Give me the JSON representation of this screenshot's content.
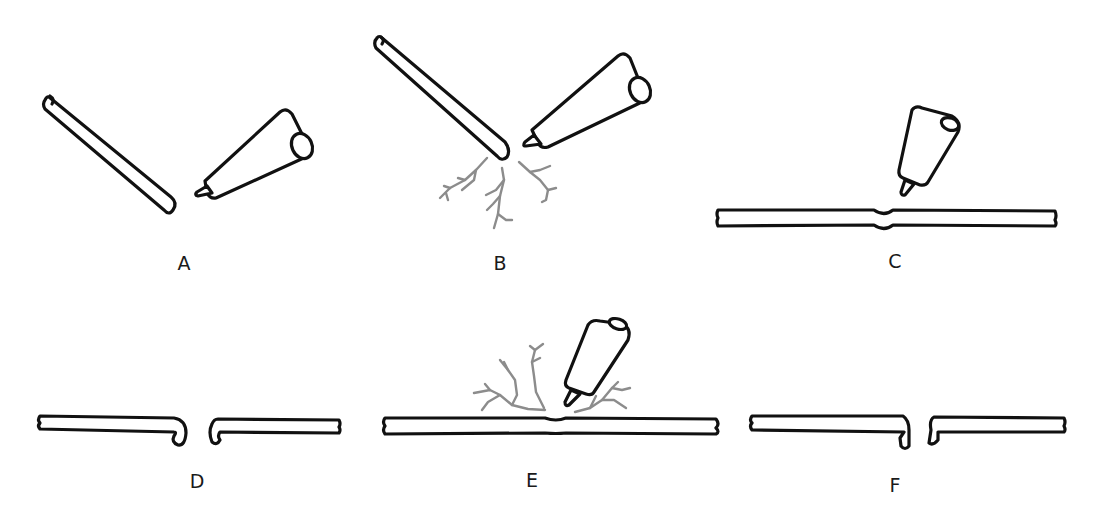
{
  "diagram": {
    "type": "step-sequence illustration",
    "panels": [
      {
        "id": "A",
        "label": "A",
        "description": "Angled rod approaching electrode tip"
      },
      {
        "id": "B",
        "label": "B",
        "description": "Rod end touching electrode tip with branching sparks"
      },
      {
        "id": "C",
        "label": "C",
        "description": "Electrode above horizontal rod with slight dent"
      },
      {
        "id": "D",
        "label": "D",
        "description": "Rod separated into two pieces with curled ends"
      },
      {
        "id": "E",
        "label": "E",
        "description": "Electrode near horizontal rod with branching sparks"
      },
      {
        "id": "F",
        "label": "F",
        "description": "Rod separated into two pieces with squared jagged ends"
      }
    ],
    "colors": {
      "outline": "#111111",
      "spark": "#8c8c8c",
      "background": "#ffffff"
    }
  }
}
